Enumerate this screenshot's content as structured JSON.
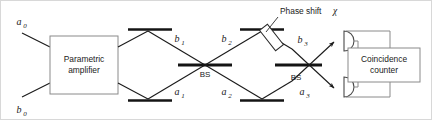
{
  "figure": {
    "type": "optics-schematic"
  },
  "blocks": {
    "amplifier": {
      "line1": "Parametric",
      "line2": "amplifier"
    },
    "counter": {
      "line1": "Coincidence",
      "line2": "counter"
    }
  },
  "beam_splitters": {
    "left_label": "BS",
    "right_label": "BS"
  },
  "annotations": {
    "phase_shift_text": "Phase shift",
    "phase_shift_symbol": "χ"
  },
  "mode_labels": {
    "input_upper": {
      "base": "a",
      "sub": "0"
    },
    "input_lower": {
      "base": "b",
      "sub": "0"
    },
    "arm1_upper": {
      "base": "b",
      "sub": "1"
    },
    "arm1_lower": {
      "base": "a",
      "sub": "1"
    },
    "arm2_upper": {
      "base": "b",
      "sub": "2"
    },
    "arm2_lower": {
      "base": "a",
      "sub": "2"
    },
    "out_upper": {
      "base": "b",
      "sub": "3"
    },
    "out_lower": {
      "base": "a",
      "sub": "3"
    }
  },
  "colors": {
    "beam": "#1a1a1a",
    "optic": "#141414",
    "box_stroke": "#8a8a8a",
    "wire": "#8a8a8a",
    "detector_stroke": "#4a4a4a",
    "frame": "#d8d8d8",
    "background": "#ffffff"
  }
}
